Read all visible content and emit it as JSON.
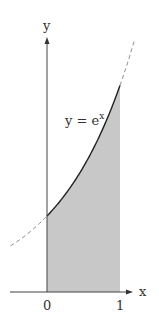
{
  "chart_data": {
    "type": "area",
    "title": "",
    "function": "y = e^x",
    "curve_label": "y = e",
    "curve_label_exponent": "x",
    "xlabel": "x",
    "ylabel": "y",
    "x_ticks": [
      "0",
      "1"
    ],
    "shaded_interval": [
      0,
      1
    ],
    "solid_curve_domain": [
      0,
      1
    ],
    "dashed_curve_domain": [
      -0.5,
      1.2
    ],
    "points": [
      {
        "x": -0.5,
        "y": 0.607
      },
      {
        "x": 0,
        "y": 1.0
      },
      {
        "x": 0.25,
        "y": 1.284
      },
      {
        "x": 0.5,
        "y": 1.649
      },
      {
        "x": 0.75,
        "y": 2.117
      },
      {
        "x": 1,
        "y": 2.718
      },
      {
        "x": 1.2,
        "y": 3.32
      }
    ],
    "grid": false,
    "colors": {
      "shade": "#c8c8c8",
      "curve": "#222222",
      "axis": "#444444",
      "dashed": "#888888"
    }
  }
}
